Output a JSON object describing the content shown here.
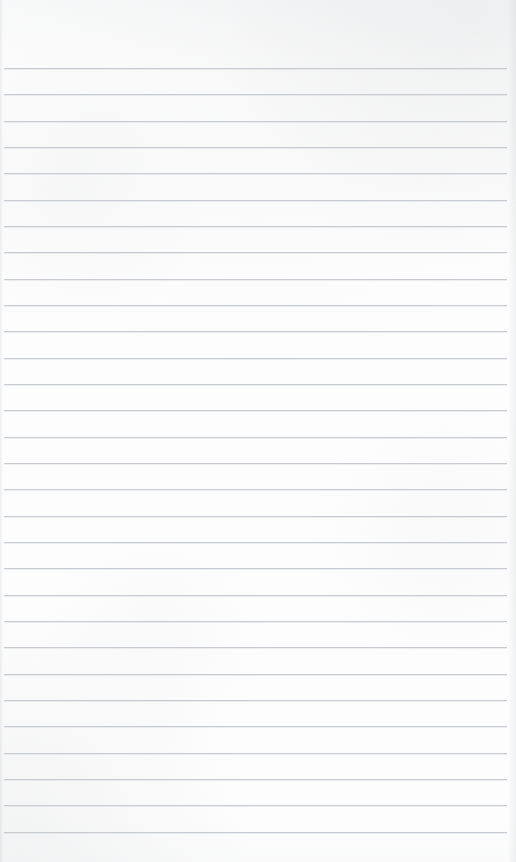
{
  "document": {
    "kind": "lined-notebook-page",
    "content_text": "",
    "page_width": 516,
    "page_height": 862,
    "background_color": "#fdfdfd",
    "rule_color": "#c6cace",
    "rule_thickness_px": 1,
    "rule_count": 30,
    "first_rule_y": 68,
    "rule_spacing_px": 26.3,
    "last_rule_y": 843,
    "rule_left_x": 4,
    "rule_right_x": 507,
    "top_margin_px": 68,
    "left_margin_px": 4,
    "right_margin_px": 9,
    "has_margin_rule": false,
    "has_header": false,
    "has_page_number": false,
    "has_handwriting": false,
    "rules": [
      {
        "index": 1,
        "y": 68,
        "text": ""
      },
      {
        "index": 2,
        "y": 94,
        "text": ""
      },
      {
        "index": 3,
        "y": 121,
        "text": ""
      },
      {
        "index": 4,
        "y": 147,
        "text": ""
      },
      {
        "index": 5,
        "y": 173,
        "text": ""
      },
      {
        "index": 6,
        "y": 200,
        "text": ""
      },
      {
        "index": 7,
        "y": 226,
        "text": ""
      },
      {
        "index": 8,
        "y": 252,
        "text": ""
      },
      {
        "index": 9,
        "y": 279,
        "text": ""
      },
      {
        "index": 10,
        "y": 305,
        "text": ""
      },
      {
        "index": 11,
        "y": 331,
        "text": ""
      },
      {
        "index": 12,
        "y": 358,
        "text": ""
      },
      {
        "index": 13,
        "y": 384,
        "text": ""
      },
      {
        "index": 14,
        "y": 410,
        "text": ""
      },
      {
        "index": 15,
        "y": 437,
        "text": ""
      },
      {
        "index": 16,
        "y": 463,
        "text": ""
      },
      {
        "index": 17,
        "y": 489,
        "text": ""
      },
      {
        "index": 18,
        "y": 516,
        "text": ""
      },
      {
        "index": 19,
        "y": 542,
        "text": ""
      },
      {
        "index": 20,
        "y": 568,
        "text": ""
      },
      {
        "index": 21,
        "y": 595,
        "text": ""
      },
      {
        "index": 22,
        "y": 621,
        "text": ""
      },
      {
        "index": 23,
        "y": 647,
        "text": ""
      },
      {
        "index": 24,
        "y": 674,
        "text": ""
      },
      {
        "index": 25,
        "y": 700,
        "text": ""
      },
      {
        "index": 26,
        "y": 726,
        "text": ""
      },
      {
        "index": 27,
        "y": 753,
        "text": ""
      },
      {
        "index": 28,
        "y": 779,
        "text": ""
      },
      {
        "index": 29,
        "y": 805,
        "text": ""
      },
      {
        "index": 30,
        "y": 832,
        "text": ""
      }
    ]
  }
}
